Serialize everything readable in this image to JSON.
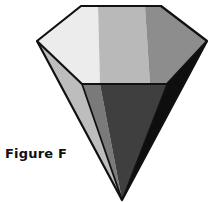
{
  "figure": {
    "label": "Figure F",
    "shape": "inverted hexagonal pyramid (gem / cone shape)",
    "colors": {
      "top_left": "#ececec",
      "top_center": "#b9b9b9",
      "top_right": "#8d8d8d",
      "side_left_light": "#bdbdbd",
      "side_left_mid": "#7a7a7a",
      "side_center": "#3f3f3f",
      "side_right": "#0e0e0e",
      "outline": "#111111"
    }
  }
}
